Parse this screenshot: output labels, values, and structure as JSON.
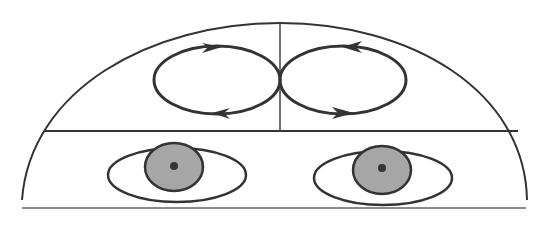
{
  "diagram": {
    "colors": {
      "stroke": "#333333",
      "thin_stroke": "#555555",
      "iris_fill": "#a6a6a6",
      "pupil": "#333333",
      "background": "#ffffff"
    },
    "regions": {
      "upper_left": {
        "loop_direction": "clockwise",
        "top_arrow": "right",
        "bottom_arrow": "left"
      },
      "upper_right": {
        "loop_direction": "counter-clockwise",
        "top_arrow": "left",
        "bottom_arrow": "right"
      },
      "lower": {
        "contents": [
          "left-eye",
          "right-eye"
        ]
      }
    },
    "eyes": [
      {
        "name": "left-eye",
        "iris_color": "#a6a6a6"
      },
      {
        "name": "right-eye",
        "iris_color": "#a6a6a6"
      }
    ]
  }
}
